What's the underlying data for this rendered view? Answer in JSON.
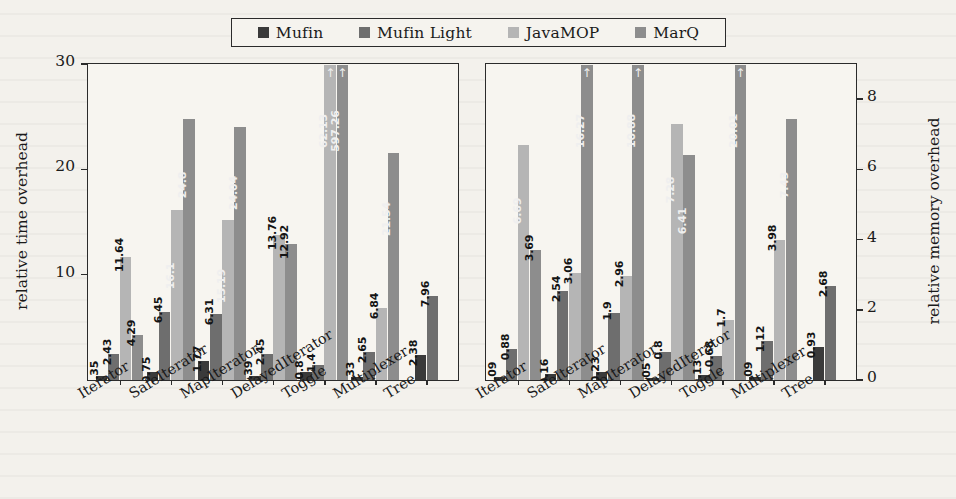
{
  "figure": {
    "background_color": "#f3f1ec",
    "frame_color": "#2b2b2b"
  },
  "legend": {
    "position": "top-center",
    "entries": [
      {
        "label": "Mufin",
        "color": "#3a3a3a"
      },
      {
        "label": "Mufin Light",
        "color": "#6e6e6e"
      },
      {
        "label": "JavaMOP",
        "color": "#b5b5b5"
      },
      {
        "label": "MarQ",
        "color": "#8d8d8d"
      }
    ]
  },
  "chart_data": [
    {
      "id": "time",
      "type": "bar",
      "title": "",
      "xlabel": "",
      "ylabel": "relative time overhead",
      "ylim": [
        0,
        30
      ],
      "yticks": [
        10,
        20,
        30
      ],
      "grid": false,
      "legend_position": "top-center",
      "categories": [
        "Iterator",
        "SafeIterator",
        "MapIterator",
        "DelayedIterator",
        "Toggle",
        "Multiplexer",
        "Tree"
      ],
      "series": [
        {
          "name": "Mufin",
          "color": "#3a3a3a",
          "values": [
            0.35,
            0.75,
            1.77,
            0.39,
            0.8,
            0.33,
            2.38
          ]
        },
        {
          "name": "Mufin Light",
          "color": "#6e6e6e",
          "values": [
            2.43,
            6.45,
            6.31,
            2.45,
            1.4,
            2.65,
            7.96
          ]
        },
        {
          "name": "JavaMOP",
          "color": "#b5b5b5",
          "values": [
            11.64,
            16.1,
            15.19,
            13.76,
            62.13,
            6.84,
            null
          ]
        },
        {
          "name": "MarQ",
          "color": "#8d8d8d",
          "values": [
            4.29,
            24.8,
            24.04,
            12.92,
            597.26,
            21.54,
            null
          ]
        }
      ],
      "clipped": [
        {
          "category": "Toggle",
          "series": "JavaMOP",
          "label": "62.13",
          "marker": "↑"
        },
        {
          "category": "Toggle",
          "series": "MarQ",
          "label": "597.26",
          "marker": "↑"
        }
      ]
    },
    {
      "id": "memory",
      "type": "bar",
      "title": "",
      "xlabel": "",
      "ylabel": "relative memory overhead",
      "ylim": [
        0,
        9
      ],
      "yticks": [
        0,
        2,
        4,
        6,
        8
      ],
      "grid": false,
      "legend_position": "top-center",
      "categories": [
        "Iterator",
        "SafeIterator",
        "MapIterator",
        "DelayedIterator",
        "Toggle",
        "Multiplexer",
        "Tree"
      ],
      "series": [
        {
          "name": "Mufin",
          "color": "#3a3a3a",
          "values": [
            0.09,
            0.16,
            0.23,
            0.05,
            0.13,
            0.09,
            0.93
          ]
        },
        {
          "name": "Mufin Light",
          "color": "#6e6e6e",
          "values": [
            0.88,
            2.54,
            1.9,
            0.8,
            0.68,
            1.12,
            2.68
          ]
        },
        {
          "name": "JavaMOP",
          "color": "#b5b5b5",
          "values": [
            6.69,
            3.06,
            2.96,
            7.28,
            1.7,
            3.98,
            null
          ]
        },
        {
          "name": "MarQ",
          "color": "#8d8d8d",
          "values": [
            3.69,
            16.27,
            10.88,
            6.41,
            20.01,
            7.43,
            null
          ]
        }
      ],
      "clipped": [
        {
          "category": "SafeIterator",
          "series": "MarQ",
          "label": "16.27",
          "marker": "↑"
        },
        {
          "category": "MapIterator",
          "series": "MarQ",
          "label": "10.88",
          "marker": "↑"
        },
        {
          "category": "Toggle",
          "series": "MarQ",
          "label": "20.01",
          "marker": "↑"
        }
      ]
    }
  ]
}
